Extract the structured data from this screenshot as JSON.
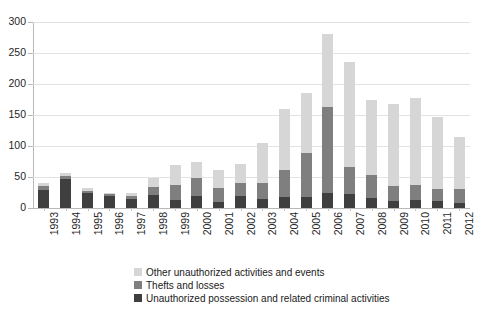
{
  "chart_data": {
    "type": "bar",
    "stacked": true,
    "title": "",
    "subtitle": "",
    "xlabel": "",
    "ylabel": "",
    "ylim": [
      0,
      300
    ],
    "ytick_step": 50,
    "yticks": [
      0,
      50,
      100,
      150,
      200,
      250,
      300
    ],
    "ytick_labels": [
      "0",
      "50",
      "100",
      "150",
      "200",
      "250",
      "300"
    ],
    "grid": true,
    "legend_position": "bottom",
    "categories": [
      "1993",
      "1994",
      "1995",
      "1996",
      "1997",
      "1998",
      "1999",
      "2000",
      "2001",
      "2002",
      "2003",
      "2004",
      "2005",
      "2006",
      "2007",
      "2008",
      "2009",
      "2010",
      "2011",
      "2012"
    ],
    "series": [
      {
        "name": "Unauthorized possession and related criminal activities",
        "color": "#3f3f3f",
        "values": [
          29,
          47,
          24,
          19,
          15,
          21,
          13,
          19,
          10,
          19,
          15,
          18,
          18,
          25,
          22,
          16,
          11,
          13,
          12,
          8
        ]
      },
      {
        "name": "Thefts and losses",
        "color": "#7f7f7f",
        "values": [
          7,
          5,
          4,
          3,
          5,
          13,
          24,
          29,
          23,
          22,
          25,
          44,
          70,
          138,
          44,
          38,
          25,
          24,
          19,
          22
        ]
      },
      {
        "name": "Other unauthorized activities and events",
        "color": "#d6d6d6",
        "values": [
          4,
          5,
          4,
          2,
          5,
          15,
          33,
          26,
          29,
          30,
          65,
          98,
          97,
          117,
          170,
          121,
          132,
          141,
          116,
          85
        ]
      }
    ],
    "totals": [
      40,
      57,
      32,
      24,
      25,
      49,
      70,
      74,
      62,
      71,
      105,
      160,
      185,
      280,
      236,
      175,
      168,
      178,
      147,
      115
    ]
  },
  "legend": {
    "items": [
      {
        "label": "Other unauthorized activities and events",
        "color": "#d6d6d6"
      },
      {
        "label": "Thefts and losses",
        "color": "#7f7f7f"
      },
      {
        "label": "Unauthorized possession and related criminal activities",
        "color": "#3f3f3f"
      }
    ]
  }
}
